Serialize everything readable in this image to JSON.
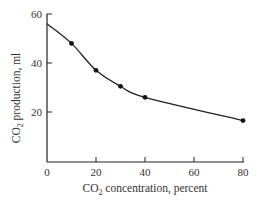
{
  "chart_data": {
    "type": "line",
    "title": "",
    "xlabel": "CO₂ concentration, percent",
    "ylabel": "CO₂ production, ml",
    "xlim": [
      0,
      80
    ],
    "ylim": [
      0,
      60
    ],
    "x_ticks": [
      0,
      20,
      40,
      60,
      80
    ],
    "y_ticks": [
      20,
      40,
      60
    ],
    "grid": false,
    "legend": null,
    "series": [
      {
        "name": "CO2 production",
        "curve_start": {
          "x": 0,
          "y": 56
        },
        "x": [
          10,
          20,
          30,
          40,
          80
        ],
        "y": [
          48,
          37,
          30.5,
          26,
          16.5
        ],
        "marker": "dot",
        "smooth": true
      }
    ]
  },
  "labels": {
    "xlabel_prefix": "CO",
    "xlabel_sub": "2",
    "xlabel_suffix": " concentration, percent",
    "ylabel_prefix": "CO",
    "ylabel_sub": "2",
    "ylabel_suffix": " production, ml",
    "x_tick_0": "0",
    "x_tick_20": "20",
    "x_tick_40": "40",
    "x_tick_60": "60",
    "x_tick_80": "80",
    "y_tick_20": "20",
    "y_tick_40": "40",
    "y_tick_60": "60"
  }
}
